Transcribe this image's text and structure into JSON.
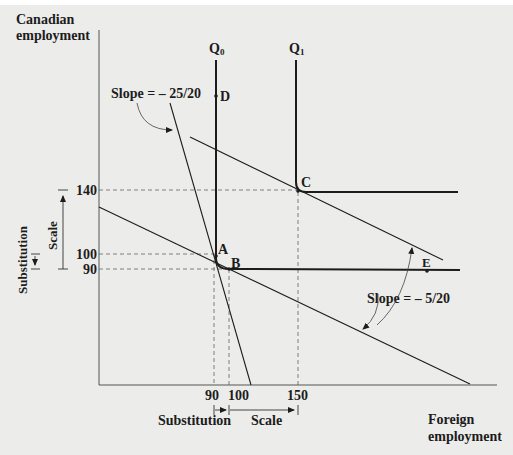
{
  "diagram": {
    "y_axis_label": [
      "Canadian",
      "employment"
    ],
    "x_axis_label": [
      "Foreign",
      "employment"
    ],
    "isoquants": [
      {
        "label": "Q",
        "subscript": "0"
      },
      {
        "label": "Q",
        "subscript": "1"
      }
    ],
    "points": {
      "A": "A",
      "B": "B",
      "C": "C",
      "D": "D",
      "E": "E"
    },
    "y_ticks": [
      "140",
      "100",
      "90"
    ],
    "x_ticks": [
      "90",
      "100",
      "150"
    ],
    "slope_labels": {
      "steep": "Slope = – 25/20",
      "flat": "Slope = – 5/20"
    },
    "effects": {
      "y_substitution": "Substitution",
      "y_scale": "Scale",
      "x_substitution": "Substitution",
      "x_scale": "Scale"
    },
    "colors": {
      "background": "#ececea",
      "line": "#1c1c1c",
      "dashed": "#555555"
    }
  }
}
